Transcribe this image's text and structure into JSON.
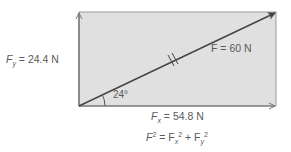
{
  "diagram": {
    "type": "force-vector-components",
    "colors": {
      "rect_fill": "#e0e0e0",
      "rect_stroke": "#8a8a8a",
      "line": "#444444",
      "text": "#5a5a5a"
    },
    "labels": {
      "fy_symbol": "F",
      "fy_sub": "y",
      "fy_value": " = 24.4 N",
      "f_label": "F = 60 N",
      "angle": "24°",
      "fx_symbol": "F",
      "fx_sub": "x",
      "fx_value": " = 54.8 N",
      "eq_lhs": "F",
      "eq_lhs_sup": "2",
      "eq_mid": " = F",
      "eq_fx_sub": "x",
      "eq_fx_sup": "2",
      "eq_plus": " + F",
      "eq_fy_sub": "y",
      "eq_fy_sup": "2"
    },
    "vectors": {
      "resultant": {
        "magnitude": "60 N",
        "angle_deg": 24
      },
      "fx": {
        "magnitude": "54.8 N"
      },
      "fy": {
        "magnitude": "24.4 N"
      }
    }
  }
}
